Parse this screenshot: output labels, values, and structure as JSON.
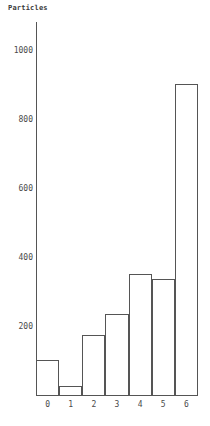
{
  "chart_data": {
    "type": "bar",
    "title": "Particles",
    "xlabel": "",
    "ylabel": "",
    "categories": [
      "0",
      "1",
      "2",
      "3",
      "4",
      "5",
      "6"
    ],
    "values": [
      100,
      25,
      175,
      235,
      350,
      335,
      900
    ],
    "yticks": [
      200,
      400,
      600,
      800,
      1000
    ],
    "ytick_labels": [
      "200",
      "400",
      "600",
      "800",
      "1000"
    ],
    "ylim": [
      0,
      1080
    ],
    "xlim": [
      -0.5,
      6.5
    ],
    "grid": false,
    "legend": null,
    "bar_edge_color": "#555555",
    "bar_fill_color": "none",
    "axis_color": "#555555",
    "text_color": "#4a4a4a"
  },
  "axes": {
    "y_axis_name": "y-axis",
    "x_axis_name": "x-axis"
  }
}
